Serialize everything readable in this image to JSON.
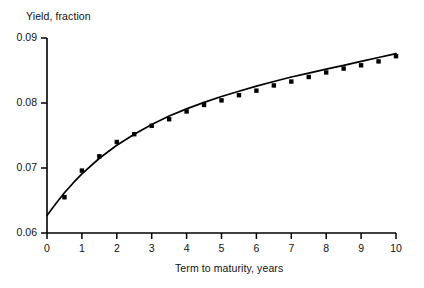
{
  "chart_data": {
    "type": "scatter",
    "title": "",
    "xlabel": "Term to maturity, years",
    "ylabel": "Yield, fraction",
    "xlim": [
      0,
      10
    ],
    "ylim": [
      0.06,
      0.09
    ],
    "xticks": [
      0,
      1,
      2,
      3,
      4,
      5,
      6,
      7,
      8,
      9,
      10
    ],
    "xtick_labels": [
      "0",
      "1",
      "2",
      "3",
      "4",
      "5",
      "6",
      "7",
      "8",
      "9",
      "10"
    ],
    "yticks": [
      0.06,
      0.07,
      0.08,
      0.09
    ],
    "ytick_labels": [
      "0.06",
      "0.07",
      "0.08",
      "0.09"
    ],
    "grid": false,
    "legend": null,
    "marker_style": "filled-square",
    "marker_color": "#000000",
    "line_color": "#000000",
    "series": [
      {
        "name": "observed yields",
        "kind": "scatter",
        "x": [
          0.5,
          1.0,
          1.5,
          2.0,
          2.5,
          3.0,
          3.5,
          4.0,
          4.5,
          5.0,
          5.5,
          6.0,
          6.5,
          7.0,
          7.5,
          8.0,
          8.5,
          9.0,
          9.5,
          10.0
        ],
        "y": [
          0.0655,
          0.0696,
          0.0718,
          0.074,
          0.0752,
          0.0765,
          0.0775,
          0.0787,
          0.0797,
          0.0804,
          0.0812,
          0.0819,
          0.0827,
          0.0833,
          0.084,
          0.0847,
          0.0853,
          0.0858,
          0.0864,
          0.0872
        ]
      },
      {
        "name": "fitted yield curve",
        "kind": "line",
        "x": [
          0.0,
          0.25,
          0.5,
          0.75,
          1.0,
          1.5,
          2.0,
          2.5,
          3.0,
          3.5,
          4.0,
          4.5,
          5.0,
          5.5,
          6.0,
          6.5,
          7.0,
          7.5,
          8.0,
          8.5,
          9.0,
          9.5,
          10.0
        ],
        "y": [
          0.0627,
          0.0645,
          0.0662,
          0.0677,
          0.0691,
          0.0715,
          0.0735,
          0.0752,
          0.0767,
          0.078,
          0.0791,
          0.0801,
          0.081,
          0.0818,
          0.0826,
          0.0833,
          0.084,
          0.0846,
          0.0852,
          0.0858,
          0.0864,
          0.087,
          0.0876
        ]
      }
    ]
  },
  "axes": {
    "y_axis_title": "Yield, fraction",
    "x_axis_title": "Term to maturity, years"
  }
}
